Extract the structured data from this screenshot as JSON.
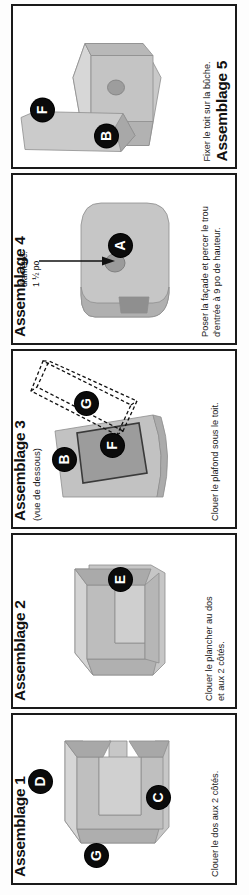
{
  "document": {
    "language": "fr",
    "orientation": "rotated-90",
    "page_background": "#ffffff",
    "border_color": "#1a1a1a",
    "wood_color": "#c8c8c8",
    "wood_shadow_color": "#a9a9a9",
    "badge_color": "#0b0b0b",
    "badge_text_color": "#ffffff"
  },
  "panels": [
    {
      "id": "assemblage-5",
      "title": "Assemblage 5",
      "subtitle": "",
      "caption": "Fixer le toit sur la bûche.",
      "badges": [
        "F",
        "B"
      ],
      "callouts": []
    },
    {
      "id": "assemblage-4",
      "title": "Assemblage 4",
      "subtitle": "",
      "caption": "Poser la façade et percer le trou\nd'entrée à 9 po de hauteur.",
      "caption_line1": "Poser la façade et percer le trou",
      "caption_line2": "d'entrée à 9 po de hauteur.",
      "badges": [
        "A"
      ],
      "callouts": [
        {
          "line1": "diamètre:",
          "line2": "1 ½ po"
        }
      ]
    },
    {
      "id": "assemblage-3",
      "title": "Assemblage 3",
      "subtitle": "(vue de dessous)",
      "caption": "Clouer le plafond sous le toit.",
      "badges": [
        "B",
        "F",
        "G"
      ],
      "callouts": []
    },
    {
      "id": "assemblage-2",
      "title": "Assemblage 2",
      "subtitle": "",
      "caption_line1": "Clouer le plancher au dos",
      "caption_line2": "et aux 2 côtés.",
      "badges": [
        "E"
      ],
      "callouts": []
    },
    {
      "id": "assemblage-1",
      "title": "Assemblage 1",
      "subtitle": "",
      "caption": "Clouer le dos aux 2 côtés.",
      "badges": [
        "D",
        "G",
        "C"
      ],
      "callouts": []
    }
  ]
}
